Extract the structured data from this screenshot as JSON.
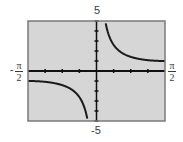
{
  "chart_data": {
    "type": "line",
    "title": "",
    "function": "y = csc(x)",
    "xlabel": "",
    "ylabel": "",
    "xlim": [
      -1.5708,
      1.5708
    ],
    "ylim": [
      -5,
      5
    ],
    "x_scale_ticks": 0.3927,
    "y_scale_ticks": 1,
    "grid": false,
    "x_tick_labels": {
      "min": {
        "sign": "-",
        "num": "π",
        "den": "2"
      },
      "max": {
        "sign": "",
        "num": "π",
        "den": "2"
      }
    },
    "y_tick_labels": {
      "max": "5",
      "min": "-5"
    },
    "series": [
      {
        "name": "left-branch",
        "x_range": [
          -1.5708,
          -0.2
        ],
        "samples": "y = 1/sin(x)"
      },
      {
        "name": "right-branch",
        "x_range": [
          0.2,
          1.5708
        ],
        "samples": "y = 1/sin(x)"
      }
    ],
    "colors": {
      "background": "#d6d6d6",
      "curve": "#1a1a1a",
      "axis": "#111111",
      "frame": "#7a7a7a"
    }
  }
}
